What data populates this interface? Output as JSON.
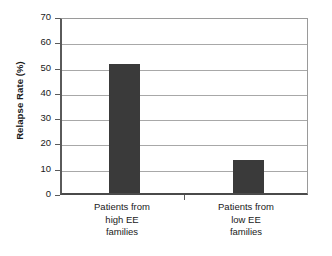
{
  "chart_data": {
    "type": "bar",
    "title": "",
    "xlabel": "",
    "ylabel": "Relapse Rate (%)",
    "categories": [
      "Patients from high EE families",
      "Patients from low EE families"
    ],
    "category_lines": [
      [
        "Patients from",
        "high EE",
        "families"
      ],
      [
        "Patients from",
        "low EE",
        "families"
      ]
    ],
    "values": [
      51,
      13
    ],
    "ylim": [
      0,
      70
    ],
    "ytick_step": 10,
    "yticks": [
      0,
      10,
      20,
      30,
      40,
      50,
      60,
      70
    ],
    "ytick_labels": [
      "0",
      "10",
      "20",
      "30",
      "40",
      "50",
      "60",
      "70"
    ],
    "grid": true,
    "grid_axis": "y",
    "legend": false,
    "legend_position": "none",
    "bar_color": "#3a3a3a",
    "background_color": "#ffffff",
    "gridline_color": "#a8a8a8",
    "axis_color": "#4a4a4a"
  }
}
